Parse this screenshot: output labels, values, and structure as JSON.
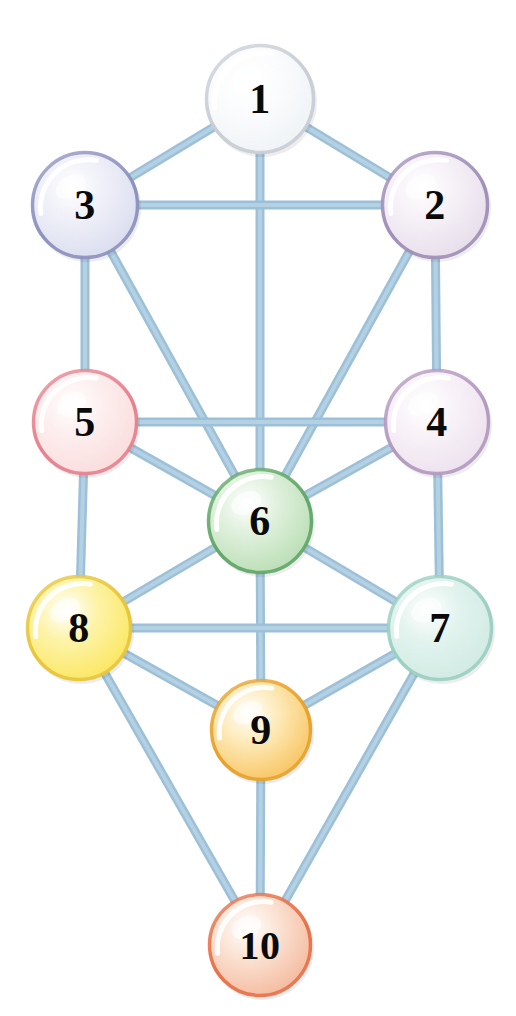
{
  "diagram": {
    "type": "node-link-diagram",
    "background_color": "#ffffff",
    "width": 516,
    "height": 1016,
    "edge_color": "#9cc0d8",
    "edge_highlight_color": "#b9d4e6",
    "edge_width": 9,
    "label_color": "#0a0a0a"
  },
  "nodes": [
    {
      "id": "1",
      "label": "1",
      "cx": 260,
      "cy": 99,
      "r": 55,
      "fill_light": "#ffffff",
      "fill_mid": "#fbfcfd",
      "fill_edge": "#eef2f6",
      "rim": "#c9ced6",
      "color_name": "white"
    },
    {
      "id": "2",
      "label": "2",
      "cx": 435,
      "cy": 205,
      "r": 54,
      "fill_light": "#ffffff",
      "fill_mid": "#f6f1f7",
      "fill_edge": "#e6dcea",
      "rim": "#a18fb8",
      "color_name": "pale-lavender"
    },
    {
      "id": "3",
      "label": "3",
      "cx": 85,
      "cy": 205,
      "r": 54,
      "fill_light": "#ffffff",
      "fill_mid": "#eff0f8",
      "fill_edge": "#d9dcef",
      "rim": "#8e92c0",
      "color_name": "pale-blue-violet"
    },
    {
      "id": "4",
      "label": "4",
      "cx": 437,
      "cy": 422,
      "r": 53,
      "fill_light": "#ffffff",
      "fill_mid": "#f8f2f8",
      "fill_edge": "#ece0ee",
      "rim": "#b49ac0",
      "color_name": "pale-mauve"
    },
    {
      "id": "5",
      "label": "5",
      "cx": 85,
      "cy": 422,
      "r": 53,
      "fill_light": "#ffffff",
      "fill_mid": "#fdeeee",
      "fill_edge": "#fadbdb",
      "rim": "#e8818f",
      "color_name": "pale-pink"
    },
    {
      "id": "6",
      "label": "6",
      "cx": 260,
      "cy": 521,
      "r": 53,
      "fill_light": "#ffffff",
      "fill_mid": "#dff0dc",
      "fill_edge": "#b7ddb2",
      "rim": "#63a86a",
      "color_name": "green"
    },
    {
      "id": "7",
      "label": "7",
      "cx": 440,
      "cy": 628,
      "r": 53,
      "fill_light": "#ffffff",
      "fill_mid": "#e2f3ee",
      "fill_edge": "#cfeae2",
      "rim": "#9ccfc3",
      "color_name": "pale-mint"
    },
    {
      "id": "8",
      "label": "8",
      "cx": 79,
      "cy": 628,
      "r": 53,
      "fill_light": "#ffffff",
      "fill_mid": "#fdf3a8",
      "fill_edge": "#fbe65c",
      "rim": "#e8c63a",
      "color_name": "yellow"
    },
    {
      "id": "9",
      "label": "9",
      "cx": 261,
      "cy": 730,
      "r": 51,
      "fill_light": "#ffffff",
      "fill_mid": "#fdeab8",
      "fill_edge": "#f8c25c",
      "rim": "#e8a22c",
      "color_name": "orange"
    },
    {
      "id": "10",
      "label": "10",
      "cx": 260,
      "cy": 945,
      "r": 52,
      "fill_light": "#ffffff",
      "fill_mid": "#fbe3d4",
      "fill_edge": "#f4b79a",
      "rim": "#e8724a",
      "color_name": "salmon"
    }
  ],
  "edges": [
    {
      "from": "1",
      "to": "3"
    },
    {
      "from": "1",
      "to": "2"
    },
    {
      "from": "1",
      "to": "6"
    },
    {
      "from": "3",
      "to": "2"
    },
    {
      "from": "3",
      "to": "5"
    },
    {
      "from": "3",
      "to": "6"
    },
    {
      "from": "2",
      "to": "4"
    },
    {
      "from": "2",
      "to": "6"
    },
    {
      "from": "5",
      "to": "4"
    },
    {
      "from": "5",
      "to": "6"
    },
    {
      "from": "4",
      "to": "6"
    },
    {
      "from": "5",
      "to": "8"
    },
    {
      "from": "4",
      "to": "7"
    },
    {
      "from": "6",
      "to": "8"
    },
    {
      "from": "6",
      "to": "7"
    },
    {
      "from": "6",
      "to": "9"
    },
    {
      "from": "8",
      "to": "7"
    },
    {
      "from": "8",
      "to": "9"
    },
    {
      "from": "8",
      "to": "10"
    },
    {
      "from": "7",
      "to": "9"
    },
    {
      "from": "7",
      "to": "10"
    },
    {
      "from": "9",
      "to": "10"
    }
  ]
}
